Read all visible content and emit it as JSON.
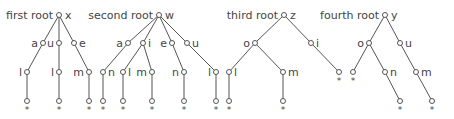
{
  "diagram": {
    "type": "tree-forest",
    "colors": {
      "line": "#555555",
      "text": "#444444",
      "background": "#ffffff"
    },
    "trees": [
      {
        "title": "first root",
        "root": {
          "id": "t1r",
          "label": "x",
          "x": 59,
          "y": 15
        },
        "nodes": [
          {
            "id": "t1a",
            "label": "a",
            "side": "left",
            "x": 43,
            "y": 43,
            "parent": "t1r"
          },
          {
            "id": "t1u",
            "label": "u",
            "side": "left",
            "x": 59,
            "y": 43,
            "parent": "t1r"
          },
          {
            "id": "t1e",
            "label": "e",
            "side": "right",
            "x": 74,
            "y": 43,
            "parent": "t1r"
          },
          {
            "id": "t1l1",
            "label": "l",
            "side": "left",
            "x": 27,
            "y": 72,
            "parent": "t1a"
          },
          {
            "id": "t1l2",
            "label": "l",
            "side": "left",
            "x": 59,
            "y": 72,
            "parent": "t1u"
          },
          {
            "id": "t1m",
            "label": "m",
            "side": "left",
            "x": 89,
            "y": 72,
            "parent": "t1e"
          },
          {
            "id": "t1f1",
            "label": "*",
            "leaf": true,
            "x": 27,
            "y": 101,
            "parent": "t1l1"
          },
          {
            "id": "t1f2",
            "label": "*",
            "leaf": true,
            "x": 59,
            "y": 101,
            "parent": "t1l2"
          },
          {
            "id": "t1f3",
            "label": "*",
            "leaf": true,
            "x": 89,
            "y": 101,
            "parent": "t1m"
          }
        ]
      },
      {
        "title": "second root",
        "root": {
          "id": "t2r",
          "label": "w",
          "x": 159,
          "y": 15
        },
        "nodes": [
          {
            "id": "t2a",
            "label": "a",
            "side": "left",
            "x": 128,
            "y": 43,
            "parent": "t2r"
          },
          {
            "id": "t2i",
            "label": "i",
            "side": "right",
            "x": 143,
            "y": 43,
            "parent": "t2r"
          },
          {
            "id": "t2e",
            "label": "e",
            "side": "left",
            "x": 172,
            "y": 43,
            "parent": "t2r"
          },
          {
            "id": "t2u",
            "label": "u",
            "side": "right",
            "x": 187,
            "y": 43,
            "parent": "t2r"
          },
          {
            "id": "t2n1",
            "label": "n",
            "side": "right",
            "x": 103,
            "y": 72,
            "parent": "t2a"
          },
          {
            "id": "t2l1",
            "label": "l",
            "side": "right",
            "x": 123,
            "y": 72,
            "parent": "t2i"
          },
          {
            "id": "t2m",
            "label": "m",
            "side": "left",
            "x": 152,
            "y": 72,
            "parent": "t2i"
          },
          {
            "id": "t2n2",
            "label": "n",
            "side": "left",
            "x": 184,
            "y": 72,
            "parent": "t2e"
          },
          {
            "id": "t2l2",
            "label": "l",
            "side": "left",
            "x": 216,
            "y": 72,
            "parent": "t2u"
          },
          {
            "id": "t2f1",
            "label": "*",
            "leaf": true,
            "x": 103,
            "y": 101,
            "parent": "t2n1"
          },
          {
            "id": "t2f2",
            "label": "*",
            "leaf": true,
            "x": 123,
            "y": 101,
            "parent": "t2l1"
          },
          {
            "id": "t2f3",
            "label": "*",
            "leaf": true,
            "x": 152,
            "y": 101,
            "parent": "t2m"
          },
          {
            "id": "t2f4",
            "label": "*",
            "leaf": true,
            "x": 184,
            "y": 101,
            "parent": "t2n2"
          },
          {
            "id": "t2f5",
            "label": "*",
            "leaf": true,
            "x": 216,
            "y": 101,
            "parent": "t2l2"
          }
        ]
      },
      {
        "title": "third root",
        "root": {
          "id": "t3r",
          "label": "z",
          "x": 284,
          "y": 15
        },
        "nodes": [
          {
            "id": "t3o",
            "label": "o",
            "side": "left",
            "x": 255,
            "y": 43,
            "parent": "t3r"
          },
          {
            "id": "t3i",
            "label": "i",
            "side": "right",
            "x": 311,
            "y": 43,
            "parent": "t3r"
          },
          {
            "id": "t3l",
            "label": "l",
            "side": "right",
            "x": 229,
            "y": 72,
            "parent": "t3o"
          },
          {
            "id": "t3m",
            "label": "m",
            "side": "right",
            "x": 283,
            "y": 72,
            "parent": "t3o"
          },
          {
            "id": "t3f1",
            "label": "*",
            "leaf": true,
            "x": 229,
            "y": 101,
            "parent": "t3l"
          },
          {
            "id": "t3f2",
            "label": "*",
            "leaf": true,
            "x": 283,
            "y": 101,
            "parent": "t3m"
          },
          {
            "id": "t3f3",
            "label": "*",
            "leaf": true,
            "x": 339,
            "y": 72,
            "parent": "t3i"
          }
        ]
      },
      {
        "title": "fourth root",
        "root": {
          "id": "t4r",
          "label": "y",
          "x": 385,
          "y": 15
        },
        "nodes": [
          {
            "id": "t4o",
            "label": "o",
            "side": "left",
            "x": 369,
            "y": 43,
            "parent": "t4r"
          },
          {
            "id": "t4u",
            "label": "u",
            "side": "right",
            "x": 400,
            "y": 43,
            "parent": "t4r"
          },
          {
            "id": "t4f1",
            "label": "*",
            "leaf": true,
            "x": 353,
            "y": 72,
            "parent": "t4o"
          },
          {
            "id": "t4n",
            "label": "n",
            "side": "right",
            "x": 385,
            "y": 72,
            "parent": "t4o"
          },
          {
            "id": "t4m",
            "label": "m",
            "side": "right",
            "x": 416,
            "y": 72,
            "parent": "t4u"
          },
          {
            "id": "t4f2",
            "label": "*",
            "leaf": true,
            "x": 400,
            "y": 101,
            "parent": "t4n"
          },
          {
            "id": "t4f3",
            "label": "*",
            "leaf": true,
            "x": 432,
            "y": 101,
            "parent": "t4m"
          }
        ]
      }
    ]
  }
}
